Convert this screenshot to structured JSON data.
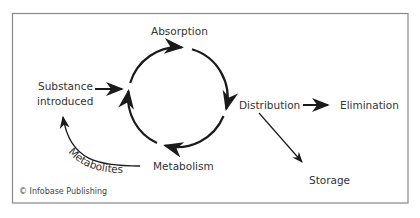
{
  "diagram": {
    "nodes": {
      "absorption": "Absorption",
      "substance_line1": "Substance",
      "substance_line2": "introduced",
      "distribution": "Distribution",
      "elimination": "Elimination",
      "storage": "Storage",
      "metabolism": "Metabolism"
    },
    "edge_labels": {
      "metabolites": "Metabolites"
    },
    "credit": "© Infobase Publishing",
    "colors": {
      "border": "#888888",
      "stroke": "#1a1a1a",
      "text": "#333333"
    }
  }
}
